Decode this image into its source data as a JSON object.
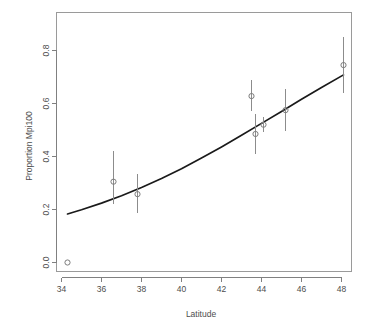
{
  "chart_data": {
    "type": "scatter",
    "title": "",
    "xlabel": "Latitude",
    "ylabel": "Proportion Mpi100",
    "xlim": [
      33.6,
      48.8
    ],
    "ylim": [
      -0.04,
      0.88
    ],
    "xticks": [
      34,
      36,
      38,
      40,
      42,
      44,
      46,
      48
    ],
    "xtick_labels": [
      "34",
      "36",
      "38",
      "40",
      "42",
      "44",
      "46",
      "48"
    ],
    "yticks": [
      0.0,
      0.2,
      0.4,
      0.6,
      0.8
    ],
    "ytick_labels": [
      "0.0",
      "0.2",
      "0.4",
      "0.6",
      "0.8"
    ],
    "grid": false,
    "legend": "none",
    "point_style": "open-circle",
    "points": [
      {
        "x": 34.3,
        "y": 0.0,
        "ylow": null,
        "yhigh": null
      },
      {
        "x": 36.6,
        "y": 0.305,
        "ylow": 0.222,
        "yhigh": 0.422
      },
      {
        "x": 37.8,
        "y": 0.258,
        "ylow": 0.188,
        "yhigh": 0.333
      },
      {
        "x": 43.5,
        "y": 0.628,
        "ylow": 0.57,
        "yhigh": 0.69
      },
      {
        "x": 43.7,
        "y": 0.485,
        "ylow": 0.408,
        "yhigh": 0.562
      },
      {
        "x": 44.1,
        "y": 0.52,
        "ylow": 0.492,
        "yhigh": 0.548
      },
      {
        "x": 45.2,
        "y": 0.575,
        "ylow": 0.498,
        "yhigh": 0.655
      },
      {
        "x": 48.1,
        "y": 0.745,
        "ylow": 0.638,
        "yhigh": 0.852
      }
    ],
    "series": [
      {
        "name": "fitted logistic curve",
        "type": "line",
        "x": [
          34.3,
          35.0,
          36.0,
          37.0,
          38.0,
          39.0,
          40.0,
          41.0,
          42.0,
          43.0,
          44.0,
          45.0,
          46.0,
          47.0,
          48.1
        ],
        "values": [
          0.183,
          0.199,
          0.224,
          0.252,
          0.283,
          0.317,
          0.354,
          0.394,
          0.436,
          0.48,
          0.525,
          0.57,
          0.616,
          0.66,
          0.708
        ]
      }
    ]
  }
}
